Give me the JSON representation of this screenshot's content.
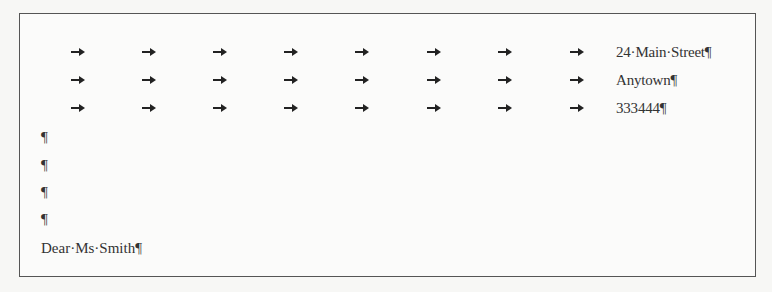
{
  "document": {
    "formatting_marks_visible": true,
    "tab_mark": "→",
    "paragraph_mark": "¶",
    "space_mark": "·",
    "address_lines": [
      {
        "text": "24·Main·Street¶",
        "tabs": 8
      },
      {
        "text": "Anytown¶",
        "tabs": 8
      },
      {
        "text": "333444¶",
        "tabs": 8
      }
    ],
    "empty_paragraphs": [
      "¶",
      "¶",
      "¶",
      "¶"
    ],
    "salutation": "Dear·Ms·Smith¶"
  }
}
